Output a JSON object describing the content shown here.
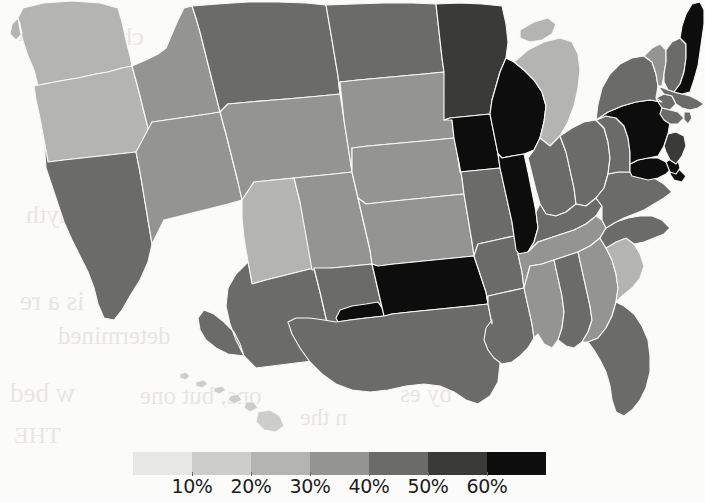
{
  "figure": {
    "kind": "choropleth-map",
    "region": "united-states",
    "background_color": "#fbfbfa",
    "border_color": "#f7f7f5"
  },
  "legend": {
    "orientation": "horizontal",
    "swatch_count": 7,
    "tick_labels": [
      "10%",
      "20%",
      "30%",
      "40%",
      "50%",
      "60%"
    ],
    "colors": [
      "#e7e7e5",
      "#cdcdcb",
      "#b4b4b2",
      "#949492",
      "#6b6b6a",
      "#3a3a39",
      "#0d0d0d"
    ],
    "bins": [
      {
        "label": "under 10%",
        "color": "#e7e7e5"
      },
      {
        "label": "10% - 20%",
        "color": "#cdcdcb"
      },
      {
        "label": "20% - 30%",
        "color": "#b4b4b2"
      },
      {
        "label": "30% - 40%",
        "color": "#949492"
      },
      {
        "label": "40% - 50%",
        "color": "#6b6b6a"
      },
      {
        "label": "50% - 60%",
        "color": "#3a3a39"
      },
      {
        "label": "over 60%",
        "color": "#0d0d0d"
      }
    ]
  },
  "bleed_through_text": [
    {
      "text": "thin",
      "x": 18,
      "y": 14,
      "size": 30
    },
    {
      "text": "chus",
      "x": 96,
      "y": 22,
      "size": 26
    },
    {
      "text": "anyth",
      "x": 26,
      "y": 200,
      "size": 26
    },
    {
      "text": "is a re",
      "x": 20,
      "y": 286,
      "size": 27
    },
    {
      "text": "determined",
      "x": 58,
      "y": 322,
      "size": 25
    },
    {
      "text": "w bed",
      "x": 10,
      "y": 378,
      "size": 27
    },
    {
      "text": "ons, but one",
      "x": 140,
      "y": 382,
      "size": 25
    },
    {
      "text": "by es",
      "x": 400,
      "y": 380,
      "size": 25
    },
    {
      "text": "n the",
      "x": 300,
      "y": 404,
      "size": 24
    },
    {
      "text": "THE",
      "x": 14,
      "y": 422,
      "size": 24
    }
  ],
  "chart_data": {
    "type": "choropleth",
    "title": "",
    "value_unit": "percent",
    "value_range": [
      0,
      70
    ],
    "states": [
      {
        "id": "WA",
        "name": "Washington",
        "value": 28,
        "color": "#b4b4b2"
      },
      {
        "id": "OR",
        "name": "Oregon",
        "value": 27,
        "color": "#b4b4b2"
      },
      {
        "id": "CA",
        "name": "California",
        "value": 47,
        "color": "#6b6b6a"
      },
      {
        "id": "ID",
        "name": "Idaho",
        "value": 33,
        "color": "#949492"
      },
      {
        "id": "NV",
        "name": "Nevada",
        "value": 31,
        "color": "#949492"
      },
      {
        "id": "MT",
        "name": "Montana",
        "value": 46,
        "color": "#6b6b6a"
      },
      {
        "id": "WY",
        "name": "Wyoming",
        "value": 36,
        "color": "#949492"
      },
      {
        "id": "UT",
        "name": "Utah",
        "value": 26,
        "color": "#b4b4b2"
      },
      {
        "id": "AZ",
        "name": "Arizona",
        "value": 47,
        "color": "#6b6b6a"
      },
      {
        "id": "CO",
        "name": "Colorado",
        "value": 35,
        "color": "#949492"
      },
      {
        "id": "NM",
        "name": "New Mexico",
        "value": 48,
        "color": "#6b6b6a"
      },
      {
        "id": "ND",
        "name": "North Dakota",
        "value": 46,
        "color": "#6b6b6a"
      },
      {
        "id": "SD",
        "name": "South Dakota",
        "value": 33,
        "color": "#949492"
      },
      {
        "id": "NE",
        "name": "Nebraska",
        "value": 32,
        "color": "#949492"
      },
      {
        "id": "KS",
        "name": "Kansas",
        "value": 37,
        "color": "#949492"
      },
      {
        "id": "OK",
        "name": "Oklahoma",
        "value": 66,
        "color": "#0d0d0d"
      },
      {
        "id": "TX",
        "name": "Texas",
        "value": 45,
        "color": "#6b6b6a"
      },
      {
        "id": "MN",
        "name": "Minnesota",
        "value": 56,
        "color": "#3a3a39"
      },
      {
        "id": "IA",
        "name": "Iowa",
        "value": 64,
        "color": "#0d0d0d"
      },
      {
        "id": "MO",
        "name": "Missouri",
        "value": 44,
        "color": "#6b6b6a"
      },
      {
        "id": "AR",
        "name": "Arkansas",
        "value": 45,
        "color": "#6b6b6a"
      },
      {
        "id": "LA",
        "name": "Louisiana",
        "value": 45,
        "color": "#6b6b6a"
      },
      {
        "id": "WI",
        "name": "Wisconsin",
        "value": 65,
        "color": "#0d0d0d"
      },
      {
        "id": "IL",
        "name": "Illinois",
        "value": 65,
        "color": "#0d0d0d"
      },
      {
        "id": "MI",
        "name": "Michigan",
        "value": 24,
        "color": "#b4b4b2"
      },
      {
        "id": "IN",
        "name": "Indiana",
        "value": 46,
        "color": "#6b6b6a"
      },
      {
        "id": "OH",
        "name": "Ohio",
        "value": 47,
        "color": "#6b6b6a"
      },
      {
        "id": "KY",
        "name": "Kentucky",
        "value": 45,
        "color": "#6b6b6a"
      },
      {
        "id": "TN",
        "name": "Tennessee",
        "value": 31,
        "color": "#949492"
      },
      {
        "id": "MS",
        "name": "Mississippi",
        "value": 33,
        "color": "#949492"
      },
      {
        "id": "AL",
        "name": "Alabama",
        "value": 44,
        "color": "#6b6b6a"
      },
      {
        "id": "GA",
        "name": "Georgia",
        "value": 38,
        "color": "#949492"
      },
      {
        "id": "FL",
        "name": "Florida",
        "value": 49,
        "color": "#6b6b6a"
      },
      {
        "id": "SC",
        "name": "South Carolina",
        "value": 29,
        "color": "#b4b4b2"
      },
      {
        "id": "NC",
        "name": "North Carolina",
        "value": 44,
        "color": "#6b6b6a"
      },
      {
        "id": "VA",
        "name": "Virginia",
        "value": 46,
        "color": "#6b6b6a"
      },
      {
        "id": "WV",
        "name": "West Virginia",
        "value": 49,
        "color": "#6b6b6a"
      },
      {
        "id": "MD",
        "name": "Maryland",
        "value": 63,
        "color": "#0d0d0d"
      },
      {
        "id": "DE",
        "name": "Delaware",
        "value": 62,
        "color": "#0d0d0d"
      },
      {
        "id": "PA",
        "name": "Pennsylvania",
        "value": 66,
        "color": "#0d0d0d"
      },
      {
        "id": "NJ",
        "name": "New Jersey",
        "value": 57,
        "color": "#3a3a39"
      },
      {
        "id": "NY",
        "name": "New York",
        "value": 48,
        "color": "#6b6b6a"
      },
      {
        "id": "CT",
        "name": "Connecticut",
        "value": 47,
        "color": "#6b6b6a"
      },
      {
        "id": "RI",
        "name": "Rhode Island",
        "value": 47,
        "color": "#6b6b6a"
      },
      {
        "id": "MA",
        "name": "Massachusetts",
        "value": 45,
        "color": "#6b6b6a"
      },
      {
        "id": "VT",
        "name": "Vermont",
        "value": 34,
        "color": "#949492"
      },
      {
        "id": "NH",
        "name": "New Hampshire",
        "value": 42,
        "color": "#6b6b6a"
      },
      {
        "id": "ME",
        "name": "Maine",
        "value": 67,
        "color": "#0d0d0d"
      },
      {
        "id": "HI",
        "name": "Hawaii",
        "value": 22,
        "color": "#cdcdcb"
      }
    ]
  },
  "geometry": {
    "viewbox": "0 0 705 440",
    "paths": {
      "WA": "M23 8 L44 3 L72 1 L100 3 L118 8 L122 22 L126 40 L130 56 L132 66 L122 68 L108 72 L96 74 L78 78 L60 81 L44 84 L38 86 L34 70 L28 56 L24 44 L20 30 L18 18 Z M18 18 L12 24 L10 34 L16 40 L22 34 L20 24 Z",
      "OR": "M34 86 L60 81 L78 78 L96 74 L108 72 L122 68 L132 66 L138 88 L144 112 L150 136 L152 150 L136 152 L118 154 L100 156 L82 158 L64 160 L48 162 L44 140 L40 118 L36 100 Z",
      "CA": "M44 140 L48 162 L64 160 L82 158 L100 156 L118 154 L136 152 L140 172 L144 196 L148 220 L152 244 L148 262 L140 280 L130 296 L122 310 L114 320 L104 318 L98 304 L94 288 L88 272 L80 256 L72 240 L64 222 L58 204 L52 186 L46 168 Z",
      "ID": "M132 66 L146 60 L158 54 L166 48 L172 34 L178 20 L184 8 L192 6 L196 18 L200 32 L204 48 L208 64 L212 80 L216 96 L220 112 L208 114 L194 116 L180 118 L166 120 L152 122 L150 136 L144 112 L138 88 Z",
      "NV": "M152 122 L166 120 L180 118 L194 116 L208 114 L220 112 L226 134 L232 158 L238 182 L242 200 L228 204 L212 208 L196 212 L180 216 L164 220 L152 244 L148 220 L144 196 L140 172 L136 152 Z",
      "MT": "M192 6 L218 4 L248 2 L278 2 L306 3 L326 5 L330 28 L334 52 L338 76 L340 94 L320 96 L298 98 L274 100 L250 102 L228 104 L220 112 L216 96 L212 80 L208 64 L204 48 L200 32 L196 18 Z",
      "WY": "M220 112 L228 104 L250 102 L274 100 L298 98 L320 96 L340 94 L344 120 L348 146 L352 172 L334 174 L314 176 L294 178 L274 180 L254 182 L242 200 L238 182 L232 158 L226 134 Z",
      "UT": "M242 200 L254 182 L274 180 L294 178 L300 202 L306 228 L312 254 L314 268 L298 272 L282 276 L266 280 L252 284 L248 262 L244 238 L242 218 Z",
      "AZ": "M248 262 L252 284 L266 280 L282 276 L298 272 L314 268 L320 292 L326 318 L332 342 L336 358 L320 360 L304 362 L288 364 L272 366 L256 368 L244 356 L236 340 L230 324 L226 306 L228 288 L236 274 Z M244 356 L228 354 L216 348 L206 340 L200 330 L198 318 L204 310 L214 314 L224 322 L234 332 L240 344 Z",
      "CO": "M294 178 L314 176 L334 174 L352 172 L358 198 L364 224 L370 250 L372 264 L352 266 L332 268 L312 270 L300 202 Z",
      "NM": "M314 268 L332 268 L352 266 L372 264 L378 290 L384 316 L390 342 L394 358 L376 360 L358 362 L340 364 L336 358 L332 342 L326 318 L320 292 Z",
      "ND": "M326 5 L354 4 L384 3 L412 3 L436 4 L438 22 L440 40 L442 58 L444 72 L424 74 L402 76 L380 78 L358 80 L340 82 L340 94 L338 76 L334 52 L330 28 Z",
      "SD": "M340 82 L358 80 L380 78 L402 76 L424 74 L444 72 L448 96 L452 120 L454 138 L434 140 L412 142 L390 144 L368 146 L352 148 L352 172 L348 146 L344 120 Z",
      "NE": "M352 148 L368 146 L390 144 L412 142 L434 140 L454 138 L458 158 L462 178 L464 194 L444 196 L424 198 L404 200 L384 202 L366 204 L358 198 L352 172 Z",
      "KS": "M358 198 L366 204 L384 202 L404 200 L424 198 L444 196 L464 194 L468 218 L472 242 L474 256 L454 258 L434 260 L414 262 L394 264 L378 266 L372 264 L370 250 L364 224 Z",
      "OK": "M372 264 L378 266 L394 264 L414 262 L434 260 L454 258 L474 256 L480 274 L486 292 L488 304 L470 306 L450 308 L430 310 L410 312 L392 314 L386 316 L384 316 L378 290 Z M384 316 L366 318 L350 320 L338 322 L336 318 L340 310 L352 306 L366 304 L378 302 L382 308 Z",
      "TX": "M336 322 L350 320 L366 318 L384 316 L392 314 L410 312 L430 310 L450 308 L470 306 L488 304 L492 324 L496 344 L500 364 L498 382 L490 396 L478 404 L466 400 L454 392 L440 386 L424 384 L406 386 L388 390 L370 392 L352 390 L336 384 L322 374 L310 362 L300 348 L292 334 L288 322 L296 318 L310 318 L324 320 Z",
      "MN": "M436 4 L460 3 L482 4 L502 6 L506 24 L508 42 L506 58 L500 72 L496 86 L492 100 L490 114 L470 116 L450 118 L444 120 L444 102 L444 72 L442 58 L440 40 L438 22 Z",
      "IA": "M444 120 L450 118 L470 116 L490 114 L494 134 L498 154 L500 168 L480 170 L460 172 L458 158 L454 138 L452 120 Z",
      "MO": "M458 158 L460 172 L480 170 L500 168 L504 186 L508 204 L512 222 L514 236 L496 240 L478 244 L474 256 L472 242 L468 218 L464 194 L462 178 Z",
      "AR": "M474 256 L478 244 L496 240 L514 236 L518 254 L522 272 L524 288 L506 292 L488 296 L488 304 L486 292 L480 274 Z",
      "LA": "M488 304 L488 296 L506 292 L524 288 L528 306 L532 324 L534 338 L528 348 L520 356 L512 362 L502 364 L494 358 L488 350 L484 340 L486 328 L492 320 L492 324 L488 304 Z",
      "WI": "M492 100 L496 86 L500 72 L506 58 L514 62 L524 70 L534 80 L542 92 L546 106 L544 122 L540 138 L534 150 L524 154 L512 156 L502 158 L498 154 L494 134 L490 114 Z",
      "IL": "M498 154 L502 158 L512 156 L524 154 L528 172 L532 192 L536 212 L538 228 L534 242 L528 252 L522 258 L516 250 L514 236 L512 222 L508 204 L504 186 L500 168 Z",
      "MI": "M514 62 L528 50 L544 42 L560 38 L572 42 L578 54 L580 70 L578 88 L574 106 L568 122 L560 136 L550 146 L540 138 L544 122 L546 106 L542 92 L534 80 L524 70 Z M520 30 L534 22 L548 18 L556 24 L552 34 L542 40 L530 42 L520 38 Z",
      "IN": "M534 150 L540 138 L550 146 L560 136 L566 152 L570 170 L574 188 L576 204 L566 212 L556 216 L546 214 L540 204 L536 190 L532 174 L528 158 Z",
      "OH": "M560 136 L572 128 L584 122 L596 120 L604 128 L608 142 L610 158 L608 174 L604 188 L596 198 L586 206 L576 204 L574 188 L570 170 L566 152 Z",
      "KY": "M540 204 L546 214 L556 216 L566 212 L576 204 L586 206 L596 198 L602 206 L596 216 L586 224 L574 230 L562 234 L550 238 L538 242 L528 252 L534 242 L538 228 L536 212 Z",
      "TN": "M528 252 L538 242 L550 238 L562 234 L574 230 L586 224 L596 216 L602 220 L606 228 L600 238 L590 246 L578 252 L566 256 L554 260 L542 264 L530 266 L524 288 L522 272 L518 254 Z",
      "MS": "M524 288 L530 266 L542 264 L554 260 L558 278 L562 296 L564 312 L562 328 L558 340 L552 348 L544 344 L538 334 L534 338 L532 324 L528 306 Z",
      "AL": "M558 340 L562 328 L564 312 L562 296 L558 278 L554 260 L566 256 L578 252 L582 270 L586 288 L590 306 L592 320 L588 332 L582 342 L574 348 L566 346 Z",
      "GA": "M578 252 L590 246 L600 238 L606 248 L612 260 L616 274 L618 288 L616 302 L612 316 L606 328 L598 338 L588 342 L582 342 L588 332 L592 320 L590 306 L586 288 L582 270 Z",
      "FL": "M598 338 L606 328 L612 316 L616 302 L624 306 L634 314 L642 326 L648 340 L650 356 L650 372 L646 388 L640 400 L632 410 L624 416 L616 412 L612 400 L610 386 L606 372 L600 360 L594 350 L588 342 Z",
      "SC": "M606 248 L616 242 L626 238 L634 244 L640 254 L644 266 L640 278 L632 288 L622 296 L616 302 L618 288 L616 274 L612 260 Z",
      "NC": "M600 238 L606 228 L616 222 L628 218 L640 216 L652 216 L662 220 L670 228 L664 234 L654 238 L644 242 L634 244 L626 238 L616 242 L606 248 Z",
      "VA": "M596 198 L604 188 L608 174 L618 172 L630 172 L642 174 L654 178 L664 184 L672 192 L664 198 L654 204 L644 210 L634 214 L624 218 L616 222 L606 228 L602 220 L602 206 Z",
      "WV": "M596 120 L606 116 L616 118 L624 126 L628 138 L630 152 L630 164 L630 172 L618 172 L608 174 L610 158 L608 142 L604 128 Z",
      "MD": "M630 164 L638 160 L648 158 L658 158 L666 162 L672 168 L666 174 L658 178 L648 180 L640 178 L632 176 L630 172 Z M672 168 L680 170 L686 176 L682 182 L674 180 L670 174 Z",
      "DE": "M666 162 L672 158 L678 160 L680 168 L676 174 L670 172 Z",
      "PA": "M596 120 L608 112 L622 106 L636 102 L650 100 L662 102 L668 110 L670 122 L668 134 L664 146 L658 156 L648 158 L638 160 L630 164 L630 152 L628 138 L624 126 L616 118 L606 116 Z",
      "NJ": "M668 134 L676 132 L684 136 L686 146 L682 156 L676 164 L670 160 L666 152 L664 146 Z",
      "NY": "M596 120 L598 104 L602 88 L610 74 L620 64 L632 58 L644 56 L652 62 L656 74 L658 86 L656 98 L662 102 L650 100 L636 102 L622 106 L608 112 Z M656 98 L664 94 L672 96 L676 104 L670 110 L662 108 L658 102 Z",
      "VT": "M644 56 L652 48 L660 44 L666 50 L666 62 L664 74 L662 86 L658 86 L656 74 L652 62 Z",
      "NH": "M666 50 L672 42 L680 38 L686 44 L686 58 L684 72 L680 84 L674 92 L668 90 L664 82 L664 74 L666 62 Z",
      "MA": "M658 86 L668 90 L674 92 L682 94 L690 96 L698 100 L704 104 L698 108 L690 110 L682 108 L676 104 L672 96 L664 94 Z",
      "CT": "M662 108 L670 110 L678 112 L684 118 L678 124 L670 124 L664 120 L660 114 Z",
      "RI": "M684 112 L690 112 L692 118 L688 124 L684 120 Z",
      "ME": "M680 38 L682 26 L686 14 L692 4 L700 2 L704 10 L704 24 L702 38 L700 52 L698 66 L694 80 L690 92 L682 94 L674 92 L680 84 L684 72 L686 58 L686 44 Z",
      "HI1": "M180 374 L186 372 L190 376 L186 380 L180 378 Z",
      "HI2": "M196 382 L204 380 L208 384 L202 388 L196 386 Z",
      "HI3": "M214 388 L222 386 L226 390 L220 394 L214 392 Z",
      "HI4": "M230 396 L238 394 L242 400 L234 404 L228 400 Z",
      "HI5": "M246 402 L254 402 L258 408 L250 412 L244 408 Z",
      "HI6": "M258 412 L270 410 L280 416 L284 426 L276 432 L264 430 L256 422 Z"
    }
  }
}
